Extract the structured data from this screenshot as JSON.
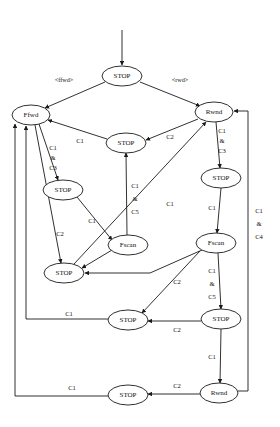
{
  "diagram": {
    "type": "state-machine",
    "background_color": "#ffffff",
    "stroke_color": "#1a1a1a",
    "nodes": [
      {
        "id": "n_start_stop",
        "label": "STOP",
        "cx": 122,
        "cy": 76,
        "rx": 20,
        "ry": 10
      },
      {
        "id": "n_ffwd",
        "label": "Ffwd",
        "cx": 31,
        "cy": 115,
        "rx": 19,
        "ry": 10
      },
      {
        "id": "n_rwnd_top",
        "label": "Rwnd",
        "cx": 214,
        "cy": 112,
        "rx": 19,
        "ry": 10
      },
      {
        "id": "n_stop_mid",
        "label": "STOP",
        "cx": 126,
        "cy": 143,
        "rx": 20,
        "ry": 10
      },
      {
        "id": "n_stop_left1",
        "label": "STOP",
        "cx": 63,
        "cy": 190,
        "rx": 20,
        "ry": 10
      },
      {
        "id": "n_stop_right1",
        "label": "STOP",
        "cx": 221,
        "cy": 178,
        "rx": 20,
        "ry": 10
      },
      {
        "id": "n_fscan_left",
        "label": "Fscan",
        "cx": 128,
        "cy": 245,
        "rx": 20,
        "ry": 10
      },
      {
        "id": "n_fscan_right",
        "label": "Fscan",
        "cx": 216,
        "cy": 243,
        "rx": 20,
        "ry": 10
      },
      {
        "id": "n_stop_left2",
        "label": "STOP",
        "cx": 64,
        "cy": 273,
        "rx": 20,
        "ry": 10
      },
      {
        "id": "n_stop_left3",
        "label": "STOP",
        "cx": 128,
        "cy": 320,
        "rx": 20,
        "ry": 10
      },
      {
        "id": "n_stop_right2",
        "label": "STOP",
        "cx": 221,
        "cy": 319,
        "rx": 20,
        "ry": 10
      },
      {
        "id": "n_stop_bottom",
        "label": "STOP",
        "cx": 128,
        "cy": 395,
        "rx": 20,
        "ry": 10
      },
      {
        "id": "n_rwnd_bottom",
        "label": "Rwnd",
        "cx": 219,
        "cy": 393,
        "rx": 19,
        "ry": 10
      }
    ],
    "edge_labels": [
      {
        "id": "lbl_ffwd_in",
        "text": "<ffwd>",
        "x": 64,
        "y": 79
      },
      {
        "id": "lbl_rwd_in",
        "text": "<rwd>",
        "x": 180,
        "y": 79
      },
      {
        "id": "lbl_c1_a",
        "text": "C1",
        "x": 80,
        "y": 140
      },
      {
        "id": "lbl_c2_a",
        "text": "C2",
        "x": 170,
        "y": 136
      },
      {
        "id": "lbl_c1c3_l_1",
        "text": "C1",
        "x": 53,
        "y": 147
      },
      {
        "id": "lbl_c1c3_l_2",
        "text": "&",
        "x": 53,
        "y": 157
      },
      {
        "id": "lbl_c1c3_l_3",
        "text": "C3",
        "x": 53,
        "y": 167
      },
      {
        "id": "lbl_c1c3_r_1",
        "text": "C1",
        "x": 222,
        "y": 130
      },
      {
        "id": "lbl_c1c3_r_2",
        "text": "&",
        "x": 222,
        "y": 140
      },
      {
        "id": "lbl_c1c3_r_3",
        "text": "C3",
        "x": 222,
        "y": 150
      },
      {
        "id": "lbl_c1c5_l_1",
        "text": "C1",
        "x": 135,
        "y": 185
      },
      {
        "id": "lbl_c1c5_l_2",
        "text": "&",
        "x": 135,
        "y": 198
      },
      {
        "id": "lbl_c1c5_l_3",
        "text": "C5",
        "x": 135,
        "y": 211
      },
      {
        "id": "lbl_c1_diag",
        "text": "C1",
        "x": 170,
        "y": 203
      },
      {
        "id": "lbl_c1_r_mid",
        "text": "C1",
        "x": 212,
        "y": 207
      },
      {
        "id": "lbl_c1c4_1",
        "text": "C1",
        "x": 259,
        "y": 210
      },
      {
        "id": "lbl_c1c4_2",
        "text": "&",
        "x": 259,
        "y": 223
      },
      {
        "id": "lbl_c1c4_3",
        "text": "C4",
        "x": 259,
        "y": 236
      },
      {
        "id": "lbl_c1_b",
        "text": "C1",
        "x": 92,
        "y": 220
      },
      {
        "id": "lbl_c2_b",
        "text": "C2",
        "x": 60,
        "y": 233
      },
      {
        "id": "lbl_c1c5_r_1",
        "text": "C1",
        "x": 212,
        "y": 270
      },
      {
        "id": "lbl_c1c5_r_2",
        "text": "&",
        "x": 212,
        "y": 283
      },
      {
        "id": "lbl_c1c5_r_3",
        "text": "C5",
        "x": 212,
        "y": 296
      },
      {
        "id": "lbl_c2_c",
        "text": "C2",
        "x": 177,
        "y": 281
      },
      {
        "id": "lbl_c1_c",
        "text": "C1",
        "x": 69,
        "y": 313
      },
      {
        "id": "lbl_c2_d",
        "text": "C2",
        "x": 177,
        "y": 329
      },
      {
        "id": "lbl_c1_d",
        "text": "C1",
        "x": 212,
        "y": 356
      },
      {
        "id": "lbl_c1_e",
        "text": "C1",
        "x": 72,
        "y": 387
      },
      {
        "id": "lbl_c2_e",
        "text": "C2",
        "x": 177,
        "y": 385
      }
    ],
    "transitions": [
      {
        "from": "entry",
        "to": "n_start_stop",
        "label": ""
      },
      {
        "from": "n_start_stop",
        "to": "n_ffwd",
        "label": "<ffwd>"
      },
      {
        "from": "n_start_stop",
        "to": "n_rwnd_top",
        "label": "<rwd>"
      },
      {
        "from": "n_stop_mid",
        "to": "n_ffwd",
        "label": "C1"
      },
      {
        "from": "n_rwnd_top",
        "to": "n_stop_mid",
        "label": "C2"
      },
      {
        "from": "n_ffwd",
        "to": "n_stop_left1",
        "label": "C1 & C3"
      },
      {
        "from": "n_rwnd_top",
        "to": "n_stop_right1",
        "label": "C1 & C3"
      },
      {
        "from": "n_stop_left1",
        "to": "n_fscan_left",
        "label": "C1"
      },
      {
        "from": "n_fscan_left",
        "to": "n_stop_mid",
        "label": "C1 & C5"
      },
      {
        "from": "n_stop_right1",
        "to": "n_fscan_right",
        "label": "C1"
      },
      {
        "from": "n_ffwd",
        "to": "n_stop_left2",
        "label": "C2"
      },
      {
        "from": "n_fscan_left",
        "to": "n_stop_left2",
        "label": ""
      },
      {
        "from": "n_fscan_right",
        "to": "n_stop_left2",
        "label": ""
      },
      {
        "from": "n_stop_left2",
        "to": "n_rwnd_top",
        "label": "C1"
      },
      {
        "from": "n_fscan_right",
        "to": "n_stop_right2",
        "label": "C1 & C5"
      },
      {
        "from": "n_fscan_right",
        "to": "n_stop_left3",
        "label": "C2"
      },
      {
        "from": "n_stop_right2",
        "to": "n_stop_left3",
        "label": "C2"
      },
      {
        "from": "n_stop_left3",
        "to": "n_ffwd",
        "label": "C1"
      },
      {
        "from": "n_stop_right2",
        "to": "n_rwnd_bottom",
        "label": "C1"
      },
      {
        "from": "n_rwnd_bottom",
        "to": "n_stop_bottom",
        "label": "C2"
      },
      {
        "from": "n_stop_bottom",
        "to": "n_ffwd",
        "label": "C1"
      },
      {
        "from": "n_rwnd_bottom",
        "to": "n_rwnd_top",
        "label": "C1 & C4"
      }
    ]
  }
}
